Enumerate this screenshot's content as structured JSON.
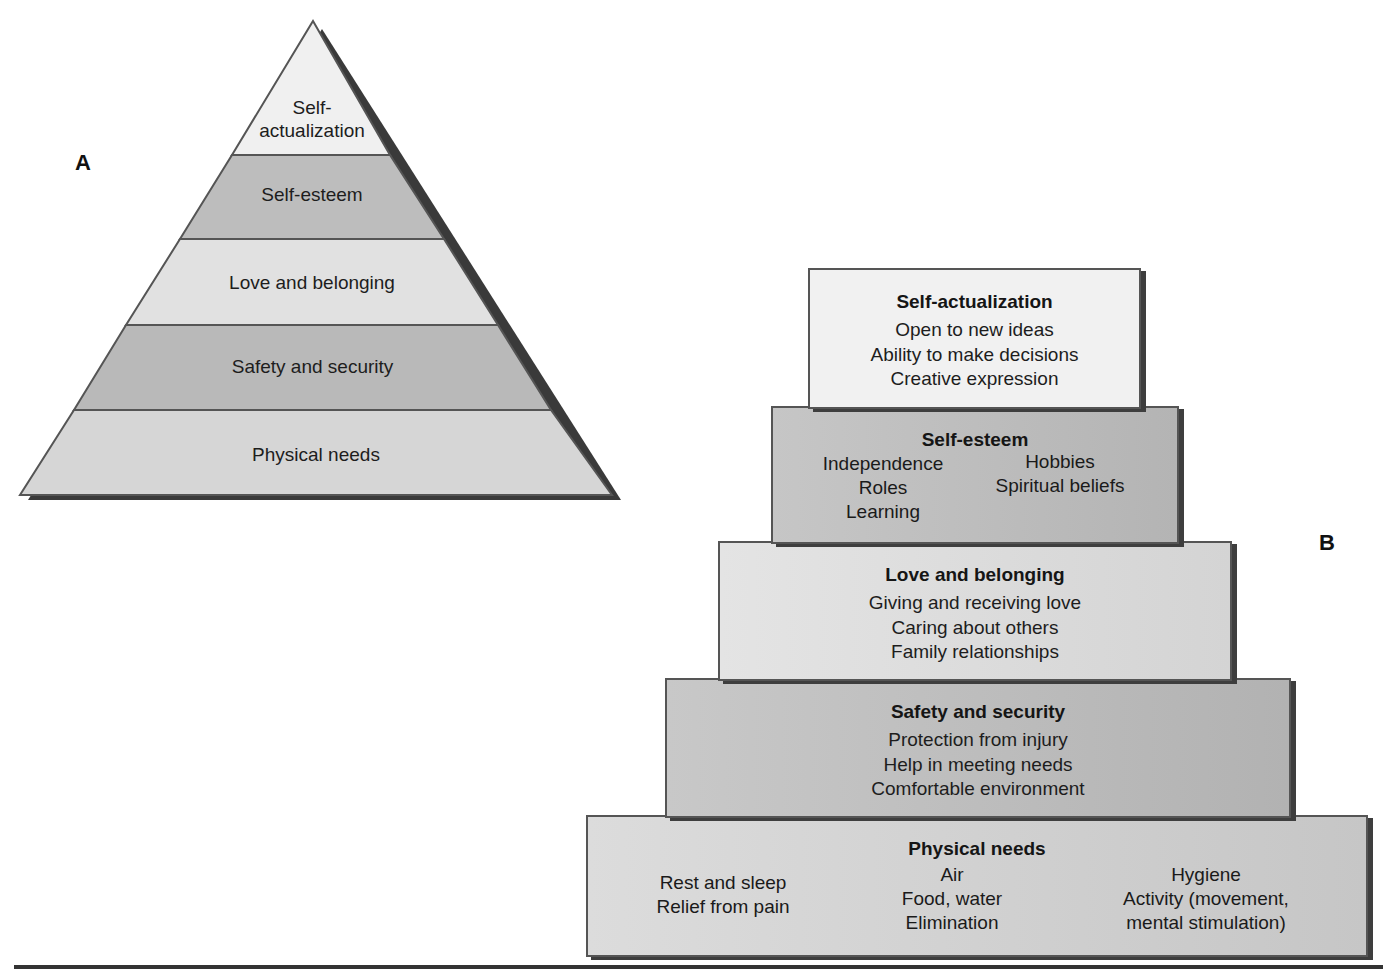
{
  "panel_a": {
    "label": "A",
    "levels": [
      {
        "name_line1": "Self-",
        "name_line2": "actualization",
        "fill": "#f0f0f0"
      },
      {
        "name": "Self-esteem",
        "fill": "#bdbdbd"
      },
      {
        "name": "Love and belonging",
        "fill": "#e1e1e1"
      },
      {
        "name": "Safety and security",
        "fill": "#b9b9b9"
      },
      {
        "name": "Physical needs",
        "fill": "#d6d6d6"
      }
    ]
  },
  "panel_b": {
    "label": "B",
    "levels": [
      {
        "title": "Self-actualization",
        "items": [
          "Open to new ideas",
          "Ability to make decisions",
          "Creative expression"
        ],
        "fill": "#f1f1f1"
      },
      {
        "title": "Self-esteem",
        "col1": [
          "Independence",
          "Roles",
          "Learning"
        ],
        "col2": [
          "Hobbies",
          "Spiritual beliefs"
        ],
        "fill": "#bcbcbc"
      },
      {
        "title": "Love and belonging",
        "items": [
          "Giving and receiving love",
          "Caring about others",
          "Family relationships"
        ],
        "fill": "#dedede"
      },
      {
        "title": "Safety and security",
        "items": [
          "Protection from injury",
          "Help in meeting needs",
          "Comfortable environment"
        ],
        "fill": "#bababa"
      },
      {
        "title": "Physical needs",
        "col1": [
          "Rest and sleep",
          "Relief from pain"
        ],
        "col2": [
          "Air",
          "Food, water",
          "Elimination"
        ],
        "col3": [
          "Hygiene",
          "Activity (movement,",
          "mental stimulation)"
        ],
        "fill": "#d2d2d2"
      }
    ]
  }
}
